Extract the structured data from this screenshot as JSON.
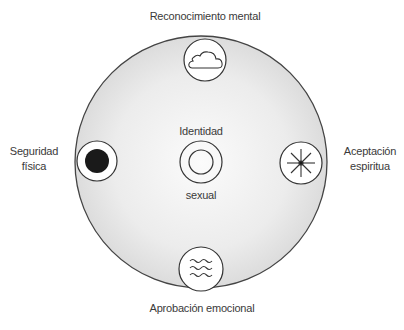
{
  "diagram": {
    "center": {
      "label_top": "Identidad",
      "label_bottom": "sexual",
      "icon": "concentric-circles-icon"
    },
    "nodes": [
      {
        "position": "top",
        "label": "Reconocimiento mental",
        "icon": "cloud-icon"
      },
      {
        "position": "left",
        "label_line1": "Seguridad",
        "label_line2": "física",
        "icon": "filled-dot-icon"
      },
      {
        "position": "right",
        "label_line1": "Aceptación",
        "label_line2": "espiritua",
        "icon": "asterisk-star-icon"
      },
      {
        "position": "bottom",
        "label": "Aprobación emocional",
        "icon": "waves-icon"
      }
    ],
    "colors": {
      "outer_circle_fill": "#e6e6e6",
      "stroke": "#333333",
      "dot": "#1a1a1a"
    }
  }
}
